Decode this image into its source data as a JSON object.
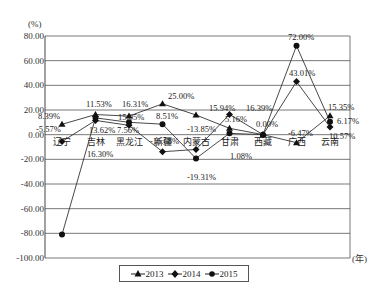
{
  "chart_data": {
    "type": "line",
    "title": "",
    "ylabel": "(%)",
    "xlabel": "(年)",
    "ylim": [
      -100,
      80
    ],
    "yticks": [
      80,
      60,
      40,
      20,
      0,
      -20,
      -40,
      -60,
      -80,
      -100
    ],
    "ytick_labels": [
      "80.00",
      "60.00",
      "40.00",
      "20.00",
      "0.00",
      "-20.00",
      "-40.00",
      "-60.00",
      "-80.00",
      "-100.00"
    ],
    "grid": true,
    "legend_position": "bottom",
    "categories": [
      "辽宁",
      "吉林",
      "黑龙江",
      "新疆",
      "内蒙古",
      "甘肃",
      "西藏",
      "广西",
      "云南"
    ],
    "series": [
      {
        "name": "2013",
        "marker": "triangle",
        "values": [
          8.39,
          16.31,
          15.05,
          25.0,
          15.94,
          5.16,
          0.0,
          -6.47,
          15.35
        ]
      },
      {
        "name": "2014",
        "marker": "diamond",
        "values": [
          -5.57,
          11.53,
          7.56,
          -13.85,
          -12.0,
          16.39,
          0.0,
          43.01,
          6.17
        ]
      },
      {
        "name": "2015",
        "marker": "circle",
        "values": [
          -81.0,
          13.62,
          10.0,
          8.51,
          -19.31,
          1.08,
          0.0,
          72.0,
          10.57
        ]
      }
    ],
    "annotations": [
      {
        "text": "8.39%",
        "x": 38,
        "y": 119
      },
      {
        "text": "-5.57%",
        "x": 36,
        "y": 132
      },
      {
        "text": "11.53%",
        "x": 86,
        "y": 107
      },
      {
        "text": "16.31%",
        "x": 122,
        "y": 107
      },
      {
        "text": "13.62%",
        "x": 89,
        "y": 133
      },
      {
        "text": "7.56%",
        "x": 117,
        "y": 133
      },
      {
        "text": "15.05%",
        "x": 118,
        "y": 120
      },
      {
        "text": "16.30%",
        "x": 87,
        "y": 157
      },
      {
        "text": "25.00%",
        "x": 168,
        "y": 99
      },
      {
        "text": "8.51%",
        "x": 156,
        "y": 119
      },
      {
        "text": "-16.68%",
        "x": 150,
        "y": 144
      },
      {
        "text": "15.94%",
        "x": 209,
        "y": 111
      },
      {
        "text": "16.39%",
        "x": 246,
        "y": 111
      },
      {
        "text": "-13.85%",
        "x": 187,
        "y": 132
      },
      {
        "text": "5.16%",
        "x": 225,
        "y": 122
      },
      {
        "text": "1.08%",
        "x": 230,
        "y": 159
      },
      {
        "text": "-19.31%",
        "x": 187,
        "y": 180
      },
      {
        "text": "0.00%",
        "x": 256,
        "y": 127
      },
      {
        "text": "72.00%",
        "x": 288,
        "y": 40
      },
      {
        "text": "43.01%",
        "x": 289,
        "y": 76
      },
      {
        "text": "15.35%",
        "x": 328,
        "y": 110
      },
      {
        "text": "6.17%",
        "x": 337,
        "y": 124
      },
      {
        "text": "-6.47%",
        "x": 288,
        "y": 136
      },
      {
        "text": "10.57%",
        "x": 329,
        "y": 139
      }
    ]
  },
  "legend": {
    "items": [
      {
        "label": "2013",
        "marker": "triangle"
      },
      {
        "label": "2014",
        "marker": "diamond"
      },
      {
        "label": "2015",
        "marker": "circle"
      }
    ]
  },
  "axis": {
    "y_unit": "(%)",
    "x_unit": "(年)"
  }
}
